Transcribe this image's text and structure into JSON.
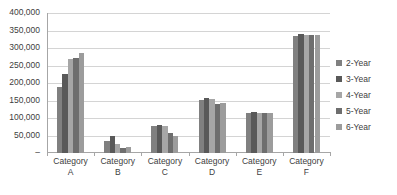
{
  "chart_data": {
    "type": "bar",
    "title": "",
    "xlabel": "",
    "ylabel": "",
    "ylim": [
      0,
      400000
    ],
    "ytick_values": [
      400000,
      350000,
      300000,
      250000,
      200000,
      150000,
      100000,
      50000,
      0
    ],
    "ytick_labels": [
      "400,000",
      "350,000",
      "300,000",
      "250,000",
      "200,000",
      "150,000",
      "100,000",
      "50,000",
      "–"
    ],
    "grid": true,
    "legend_position": "right",
    "categories": [
      "Category A",
      "Category B",
      "Category C",
      "Category D",
      "Category E",
      "Category F"
    ],
    "category_lines": [
      [
        "Category",
        "A"
      ],
      [
        "Category",
        "B"
      ],
      [
        "Category",
        "C"
      ],
      [
        "Category",
        "D"
      ],
      [
        "Category",
        "E"
      ],
      [
        "Category",
        "F"
      ]
    ],
    "series": [
      {
        "name": "2-Year",
        "color": "#808080",
        "values": [
          190000,
          33000,
          78000,
          152000,
          115000,
          335000
        ]
      },
      {
        "name": "3-Year",
        "color": "#595959",
        "values": [
          225000,
          48000,
          80000,
          158000,
          117000,
          340000
        ]
      },
      {
        "name": "4-Year",
        "color": "#a6a6a6",
        "values": [
          270000,
          25000,
          78000,
          155000,
          115000,
          337000
        ]
      },
      {
        "name": "5-Year",
        "color": "#6e6e6e",
        "values": [
          272000,
          13000,
          58000,
          140000,
          114000,
          336000
        ]
      },
      {
        "name": "6-Year",
        "color": "#9c9c9c",
        "values": [
          285000,
          18000,
          48000,
          143000,
          115000,
          338000
        ]
      }
    ]
  },
  "legend": {
    "items": [
      {
        "label": "2-Year"
      },
      {
        "label": "3-Year"
      },
      {
        "label": "4-Year"
      },
      {
        "label": "5-Year"
      },
      {
        "label": "6-Year"
      }
    ]
  },
  "colors": {
    "gridline": "#d4d4d4",
    "axis": "#a6a6a6",
    "text": "#404040",
    "background": "#ffffff"
  }
}
